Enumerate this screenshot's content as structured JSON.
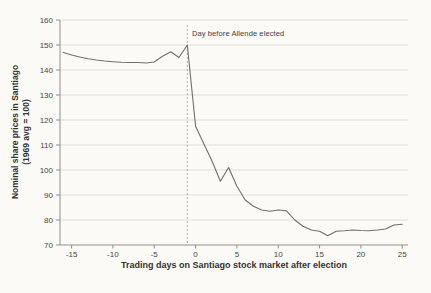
{
  "figure": {
    "background": "#fbfaf6",
    "line_color": "#6f6f6f",
    "grid_color": "#dedede",
    "axis_color": "#8f8f8f",
    "tick_text_color": "#474747",
    "dashed_line_color": "#ababab"
  },
  "chart_data": {
    "type": "line",
    "title": "",
    "xlabel": "Trading days on Santiago stock market after election",
    "ylabel_line1": "Nominal share prices in Santiago",
    "ylabel_line2": "(1969 avg = 100)",
    "xlim": [
      -16.4,
      25.7
    ],
    "ylim": [
      70,
      160
    ],
    "x_ticks": [
      -15,
      -10,
      -5,
      0,
      5,
      10,
      15,
      20,
      25
    ],
    "y_ticks": [
      70,
      80,
      90,
      100,
      110,
      120,
      130,
      140,
      150,
      160
    ],
    "grid": "horizontal",
    "legend": "none",
    "annotation": {
      "text": "Day before Allende elected",
      "x": -1
    },
    "series": [
      {
        "name": "Nominal share prices in Santiago (1969 avg = 100)",
        "points": [
          [
            -16,
            147
          ],
          [
            -15,
            146
          ],
          [
            -14,
            145.2
          ],
          [
            -13,
            144.5
          ],
          [
            -12,
            144
          ],
          [
            -11,
            143.6
          ],
          [
            -10,
            143.3
          ],
          [
            -9,
            143.1
          ],
          [
            -8,
            143
          ],
          [
            -7,
            143
          ],
          [
            -6,
            142.8
          ],
          [
            -5,
            143.2
          ],
          [
            -4,
            145.5
          ],
          [
            -3,
            147.3
          ],
          [
            -2,
            145
          ],
          [
            -1,
            150
          ],
          [
            0,
            117.5
          ],
          [
            1,
            110.5
          ],
          [
            2,
            103.5
          ],
          [
            3,
            95.5
          ],
          [
            4,
            101
          ],
          [
            5,
            93.5
          ],
          [
            6,
            88
          ],
          [
            7,
            85.5
          ],
          [
            8,
            84
          ],
          [
            9,
            83.5
          ],
          [
            10,
            84
          ],
          [
            11,
            83.7
          ],
          [
            12,
            80
          ],
          [
            13,
            77.5
          ],
          [
            14,
            76
          ],
          [
            15,
            75.5
          ],
          [
            16,
            73.7
          ],
          [
            17,
            75.5
          ],
          [
            18,
            75.7
          ],
          [
            19,
            76
          ],
          [
            20,
            75.8
          ],
          [
            21,
            75.7
          ],
          [
            22,
            76
          ],
          [
            23,
            76.4
          ],
          [
            24,
            78
          ],
          [
            25,
            78.3
          ]
        ]
      }
    ]
  }
}
